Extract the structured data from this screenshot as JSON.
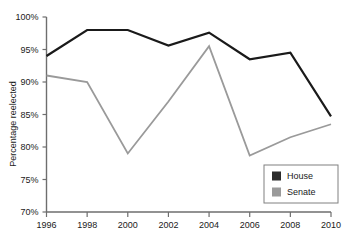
{
  "chart_data": {
    "type": "line",
    "title": "",
    "xlabel": "",
    "ylabel": "Percentage reelected",
    "categories": [
      "1996",
      "1998",
      "2000",
      "2002",
      "2004",
      "2006",
      "2008",
      "2010"
    ],
    "x": [
      1996,
      1998,
      2000,
      2002,
      2004,
      2006,
      2008,
      2010
    ],
    "xlim": [
      1996,
      2010
    ],
    "ylim": [
      70,
      100
    ],
    "ytick_values": [
      70,
      75,
      80,
      85,
      90,
      95,
      100
    ],
    "ytick_labels": [
      "70%",
      "75%",
      "80%",
      "85%",
      "90%",
      "95%",
      "100%"
    ],
    "xtick_labels": [
      "1996",
      "1998",
      "2000",
      "2002",
      "2004",
      "2006",
      "2008",
      "2010"
    ],
    "grid": false,
    "legend_position": "bottom-right",
    "series": [
      {
        "name": "House",
        "color": "#1a1a1a",
        "width": 2.2,
        "values": [
          94.0,
          98.0,
          98.0,
          95.6,
          97.6,
          93.5,
          94.5,
          84.7
        ]
      },
      {
        "name": "Senate",
        "color": "#9a9a9a",
        "width": 1.8,
        "values": [
          91.0,
          90.0,
          79.0,
          87.0,
          95.5,
          78.7,
          81.5,
          83.5
        ]
      }
    ]
  },
  "legend": {
    "items": [
      {
        "label": "House",
        "swatch_color": "#2b2b2b"
      },
      {
        "label": "Senate",
        "swatch_color": "#9a9a9a"
      }
    ]
  },
  "axes": {
    "y_title": "Percentage reelected",
    "axis_color": "#6e6e6e"
  }
}
